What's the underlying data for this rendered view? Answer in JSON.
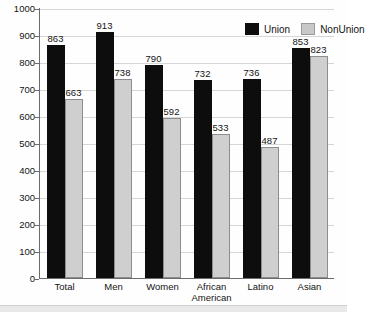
{
  "chart_data": {
    "type": "bar",
    "title": "",
    "subtitle": "",
    "xlabel": "",
    "ylabel": "",
    "ylim": [
      0,
      1000
    ],
    "ytick_step": 100,
    "yticks": [
      0,
      100,
      200,
      300,
      400,
      500,
      600,
      700,
      800,
      900,
      1000
    ],
    "ytick_labels": [
      "0",
      "100",
      "200",
      "300",
      "400",
      "500",
      "600",
      "700",
      "800",
      "900",
      "1000"
    ],
    "grid": true,
    "legend_position": "top-right-inside",
    "categories": [
      "Total",
      "Men",
      "Women",
      "African American",
      "Latino",
      "Asian"
    ],
    "category_lines": [
      [
        "Total"
      ],
      [
        "Men"
      ],
      [
        "Women"
      ],
      [
        "African",
        "American"
      ],
      [
        "Latino"
      ],
      [
        "Asian"
      ]
    ],
    "series": [
      {
        "name": "Union",
        "color": "#0d0d0d",
        "values": [
          863,
          913,
          790,
          732,
          736,
          853
        ],
        "value_labels": [
          "863",
          "913",
          "790",
          "732",
          "736",
          "853"
        ]
      },
      {
        "name": "NonUnion",
        "color": "#cfcfcf",
        "values": [
          663,
          738,
          592,
          533,
          487,
          823
        ],
        "value_labels": [
          "663",
          "738",
          "592",
          "533",
          "487",
          "823"
        ]
      }
    ]
  },
  "legend": {
    "items": [
      {
        "label": "Union",
        "swatch": "union"
      },
      {
        "label": "NonUnion",
        "swatch": "nonunion"
      }
    ]
  },
  "colors": {
    "union": "#0d0d0d",
    "nonunion": "#cfcfcf",
    "axis": "#6b6b6b",
    "grid": "#d6d6d6",
    "text": "#141414",
    "background": "#ffffff"
  }
}
